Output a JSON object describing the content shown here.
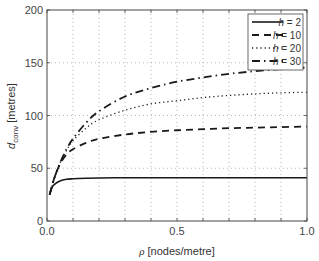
{
  "chart_data": {
    "type": "line",
    "title": "",
    "xlabel": "ρ [nodes/metre]",
    "ylabel": "d_conv [metres]",
    "ylabel_main": "d",
    "ylabel_sub": "conv",
    "ylabel_unit": "[metres]",
    "xlim": [
      0.0,
      1.0
    ],
    "ylim": [
      0,
      200
    ],
    "xticks": [
      0.0,
      0.1,
      0.2,
      0.3,
      0.4,
      0.5,
      0.6,
      0.7,
      0.8,
      0.9,
      1.0
    ],
    "xtick_labels": [
      "0.0",
      "",
      "",
      "",
      "",
      "0.5",
      "",
      "",
      "",
      "",
      "1.0"
    ],
    "yticks": [
      0,
      50,
      100,
      150,
      200
    ],
    "ytick_labels": [
      "0",
      "50",
      "100",
      "150",
      "200"
    ],
    "grid": true,
    "legend_position": "upper right",
    "x": [
      0.01,
      0.02,
      0.03,
      0.05,
      0.075,
      0.1,
      0.15,
      0.2,
      0.3,
      0.4,
      0.5,
      0.6,
      0.7,
      0.8,
      0.9,
      1.0
    ],
    "series": [
      {
        "name": "h = 2",
        "label_var": "h",
        "label_val": "2",
        "style": "solid",
        "values": [
          25,
          32,
          35,
          38,
          39.5,
          40,
          40.5,
          40.8,
          41,
          41,
          41,
          41,
          41,
          41,
          41,
          41
        ]
      },
      {
        "name": "h = 10",
        "label_var": "h",
        "label_val": "10",
        "style": "dashed",
        "values": [
          25,
          34,
          42,
          54,
          63,
          68,
          74,
          78,
          82,
          84.5,
          86,
          87,
          88,
          88.5,
          89,
          89.5
        ]
      },
      {
        "name": "h = 20",
        "label_var": "h",
        "label_val": "20",
        "style": "dotted",
        "values": [
          25,
          34,
          42,
          55,
          67,
          76,
          88,
          96,
          105,
          111,
          114,
          117,
          119,
          120.5,
          121.5,
          122
        ]
      },
      {
        "name": "h = 30",
        "label_var": "h",
        "label_val": "30",
        "style": "dashdot",
        "values": [
          25,
          34,
          42,
          55,
          68,
          78,
          93,
          104,
          118,
          126,
          132,
          136,
          139.5,
          142,
          144,
          145.5
        ]
      }
    ]
  }
}
